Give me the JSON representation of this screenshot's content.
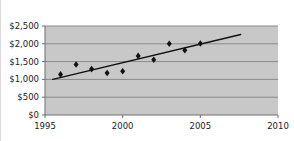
{
  "chart_data": {
    "type": "scatter",
    "title": "",
    "xlabel": "",
    "ylabel": "",
    "xlim": [
      1995,
      2010
    ],
    "ylim": [
      0,
      2500
    ],
    "grid": true,
    "legend": null,
    "x_ticks": [
      1995,
      2000,
      2005,
      2010
    ],
    "x_tick_labels": [
      "1995",
      "2000",
      "2005",
      "2010"
    ],
    "y_ticks": [
      0,
      500,
      1000,
      1500,
      2000,
      2500
    ],
    "y_tick_labels": [
      "$0",
      "$500",
      "$1,000",
      "$1,500",
      "$2,000",
      "$2,500"
    ],
    "series": [
      {
        "name": "data-points",
        "marker": "diamond",
        "color": "#111111",
        "x": [
          1996,
          1997,
          1998,
          1999,
          2000,
          2001,
          2002,
          2003,
          2004,
          2005
        ],
        "values": [
          1140,
          1420,
          1290,
          1180,
          1230,
          1660,
          1550,
          2000,
          1820,
          2010
        ]
      },
      {
        "name": "trendline",
        "marker": "none",
        "color": "#111111",
        "x": [
          1995.5,
          2007.6
        ],
        "values": [
          1000,
          2260
        ]
      }
    ],
    "plot_background": "#c8c8c8",
    "gridline_color": "#8a8a8a",
    "axis_color": "#6e6e6e"
  }
}
